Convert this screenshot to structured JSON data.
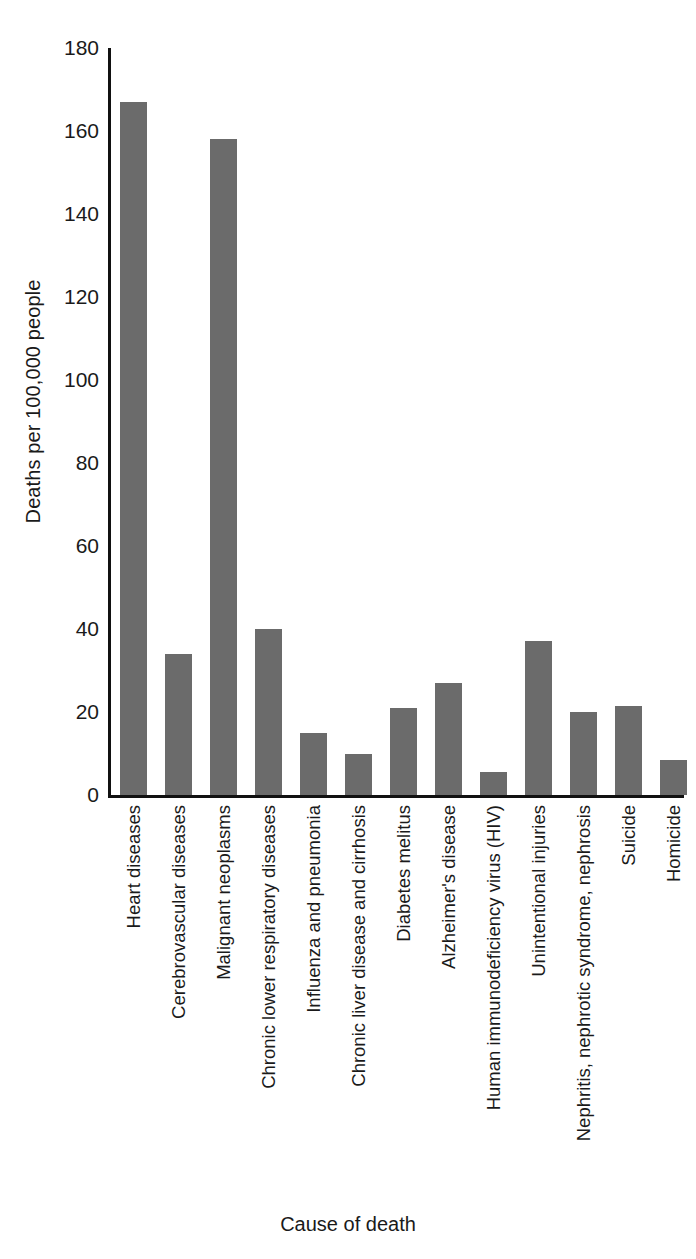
{
  "chart_data": {
    "type": "bar",
    "title": "",
    "xlabel": "Cause of death",
    "ylabel": "Deaths per 100,000 people",
    "ylim": [
      0,
      180
    ],
    "ytick_step": 20,
    "yticks": [
      "180",
      "160",
      "140",
      "120",
      "100",
      "80",
      "60",
      "40",
      "20",
      "0"
    ],
    "grid": false,
    "legend": "none",
    "bar_color": "#6b6b6b",
    "axis_color": "#111111",
    "categories": [
      "Heart diseases",
      "Cerebrovascular diseases",
      "Malignant neoplasms",
      "Chronic lower respiratory diseases",
      "Influenza and pneumonia",
      "Chronic liver disease and cirrhosis",
      "Diabetes melitus",
      "Alzheimer's disease",
      "Human immunodeficiency virus (HIV)",
      "Unintentional injuries",
      "Nephritis, nephrotic syndrome, nephrosis",
      "Suicide",
      "Homicide"
    ],
    "values": [
      167,
      34,
      158,
      40,
      15,
      10,
      21,
      27,
      5.5,
      37,
      20,
      21.5,
      8.5
    ]
  }
}
